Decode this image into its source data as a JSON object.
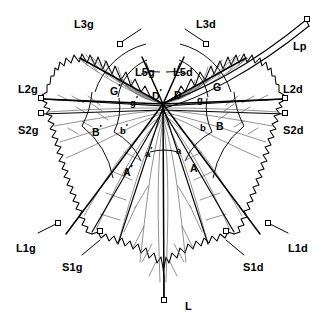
{
  "figure": {
    "stroke_color": "#000000",
    "vein_color": "#111111",
    "secondary_vein_color": "#6b6b6b",
    "background_color": "#ffffff",
    "marker_shape": "small-open-square",
    "center_label": "petiolar-point"
  },
  "length_labels": [
    {
      "id": "L3g",
      "text": "L3g",
      "x": 74,
      "y": 19,
      "desc": "left upper lateral vein length"
    },
    {
      "id": "L3d",
      "text": "L3d",
      "x": 196,
      "y": 19,
      "desc": "right upper lateral vein length"
    },
    {
      "id": "Lp",
      "text": "Lp",
      "x": 293,
      "y": 41,
      "desc": "petiole length"
    },
    {
      "id": "L5g",
      "text": "L5g",
      "x": 135,
      "y": 67,
      "desc": "left inner upper vein length"
    },
    {
      "id": "L5d",
      "text": "L5d",
      "x": 173,
      "y": 67,
      "desc": "right inner upper vein length"
    },
    {
      "id": "L2g",
      "text": "L2g",
      "x": 18,
      "y": 84,
      "desc": "left median vein length"
    },
    {
      "id": "L2d",
      "text": "L2d",
      "x": 283,
      "y": 84,
      "desc": "right median vein length"
    },
    {
      "id": "S2g",
      "text": "S2g",
      "x": 18,
      "y": 125,
      "desc": "left upper sinus depth"
    },
    {
      "id": "S2d",
      "text": "S2d",
      "x": 283,
      "y": 125,
      "desc": "right upper sinus depth"
    },
    {
      "id": "L1g",
      "text": "L1g",
      "x": 16,
      "y": 243,
      "desc": "left lower lateral vein length"
    },
    {
      "id": "L1d",
      "text": "L1d",
      "x": 288,
      "y": 243,
      "desc": "right lower lateral vein length"
    },
    {
      "id": "S1g",
      "text": "S1g",
      "x": 62,
      "y": 262,
      "desc": "left lower sinus depth"
    },
    {
      "id": "S1d",
      "text": "S1d",
      "x": 243,
      "y": 262,
      "desc": "right lower sinus depth"
    },
    {
      "id": "L",
      "text": "L",
      "x": 185,
      "y": 301,
      "desc": "main vein length"
    }
  ],
  "angle_labels": [
    {
      "id": "G-prime",
      "base": "G",
      "prime": true,
      "x": 110,
      "y": 82,
      "size": "angle",
      "desc": "left outer upper angle"
    },
    {
      "id": "D-prime",
      "base": "D",
      "prime": true,
      "x": 152,
      "y": 87,
      "size": "angle",
      "desc": "left inner upper angle"
    },
    {
      "id": "D",
      "base": "D",
      "prime": false,
      "x": 174,
      "y": 90,
      "size": "angle",
      "desc": "right inner upper angle"
    },
    {
      "id": "G",
      "base": "G",
      "prime": false,
      "x": 213,
      "y": 82,
      "size": "angle",
      "desc": "right outer upper angle"
    },
    {
      "id": "g-prime",
      "base": "g",
      "prime": true,
      "x": 130,
      "y": 95,
      "size": "angle-sm",
      "desc": "left small upper angle"
    },
    {
      "id": "g",
      "base": "g",
      "prime": false,
      "x": 197,
      "y": 95,
      "size": "angle-sm",
      "desc": "right small upper angle"
    },
    {
      "id": "B-prime",
      "base": "B",
      "prime": true,
      "x": 92,
      "y": 123,
      "size": "angle",
      "desc": "left outer median angle"
    },
    {
      "id": "b-prime",
      "base": "b",
      "prime": true,
      "x": 120,
      "y": 123,
      "size": "angle-sm",
      "desc": "left small median angle"
    },
    {
      "id": "b",
      "base": "b",
      "prime": false,
      "x": 200,
      "y": 123,
      "size": "angle-sm",
      "desc": "right small median angle"
    },
    {
      "id": "B",
      "base": "B",
      "prime": false,
      "x": 216,
      "y": 121,
      "size": "angle",
      "desc": "right outer median angle"
    },
    {
      "id": "a-prime",
      "base": "a",
      "prime": true,
      "x": 145,
      "y": 146,
      "size": "angle-sm",
      "desc": "left small lower angle"
    },
    {
      "id": "a",
      "base": "a",
      "prime": false,
      "x": 176,
      "y": 146,
      "size": "angle-sm",
      "desc": "right small lower angle"
    },
    {
      "id": "A-prime",
      "base": "A",
      "prime": true,
      "x": 123,
      "y": 163,
      "size": "angle",
      "desc": "left outer lower angle"
    },
    {
      "id": "A",
      "base": "A",
      "prime": false,
      "x": 190,
      "y": 163,
      "size": "angle",
      "desc": "right outer lower angle"
    }
  ]
}
